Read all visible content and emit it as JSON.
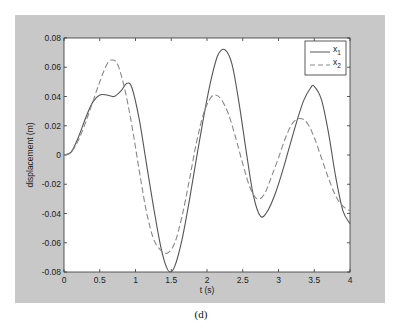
{
  "chart_data": {
    "type": "line",
    "title": "",
    "xlabel": "t (s)",
    "ylabel": "displacement (m)",
    "caption": "(d)",
    "xlim": [
      0,
      4
    ],
    "ylim": [
      -0.08,
      0.08
    ],
    "xticks": [
      0,
      0.5,
      1,
      1.5,
      2,
      2.5,
      3,
      3.5,
      4
    ],
    "xtick_labels": [
      "0",
      "0.5",
      "1",
      "1.5",
      "2",
      "2.5",
      "3",
      "3.5",
      "4"
    ],
    "yticks": [
      -0.08,
      -0.06,
      -0.04,
      -0.02,
      0,
      0.02,
      0.04,
      0.06,
      0.08
    ],
    "ytick_labels": [
      "-0.08",
      "-0.06",
      "-0.04",
      "-0.02",
      "0",
      "0.02",
      "0.04",
      "0.06",
      "0.08"
    ],
    "grid": false,
    "legend_position": "upper right",
    "series": [
      {
        "name": "x1",
        "label_base": "x",
        "label_sub": "1",
        "style": "solid",
        "color": "#555555",
        "x": [
          0,
          0.1,
          0.2,
          0.3,
          0.4,
          0.5,
          0.6,
          0.7,
          0.8,
          0.88,
          0.95,
          1.05,
          1.15,
          1.25,
          1.35,
          1.42,
          1.48,
          1.55,
          1.65,
          1.75,
          1.85,
          1.95,
          2.05,
          2.15,
          2.25,
          2.35,
          2.45,
          2.55,
          2.65,
          2.75,
          2.85,
          2.95,
          3.05,
          3.15,
          3.25,
          3.35,
          3.45,
          3.5,
          3.6,
          3.7,
          3.8,
          3.9,
          4.0
        ],
        "y": [
          0.0,
          0.002,
          0.012,
          0.025,
          0.036,
          0.041,
          0.041,
          0.04,
          0.044,
          0.049,
          0.046,
          0.025,
          -0.005,
          -0.035,
          -0.062,
          -0.075,
          -0.08,
          -0.076,
          -0.058,
          -0.032,
          -0.003,
          0.025,
          0.05,
          0.068,
          0.072,
          0.062,
          0.035,
          0.002,
          -0.028,
          -0.042,
          -0.038,
          -0.027,
          -0.012,
          0.005,
          0.022,
          0.037,
          0.046,
          0.047,
          0.038,
          0.015,
          -0.015,
          -0.038,
          -0.047
        ]
      },
      {
        "name": "x2",
        "label_base": "x",
        "label_sub": "2",
        "style": "dashed",
        "color": "#888888",
        "x": [
          0,
          0.1,
          0.2,
          0.3,
          0.4,
          0.5,
          0.6,
          0.67,
          0.75,
          0.85,
          0.95,
          1.05,
          1.15,
          1.25,
          1.35,
          1.45,
          1.55,
          1.65,
          1.75,
          1.85,
          1.95,
          2.05,
          2.12,
          2.2,
          2.3,
          2.4,
          2.5,
          2.6,
          2.7,
          2.8,
          2.9,
          3.0,
          3.1,
          3.2,
          3.3,
          3.4,
          3.5,
          3.6,
          3.7,
          3.8,
          3.9,
          4.0
        ],
        "y": [
          0.0,
          0.002,
          0.01,
          0.022,
          0.036,
          0.05,
          0.062,
          0.065,
          0.062,
          0.045,
          0.02,
          -0.01,
          -0.038,
          -0.057,
          -0.065,
          -0.067,
          -0.06,
          -0.042,
          -0.018,
          0.008,
          0.028,
          0.039,
          0.041,
          0.038,
          0.028,
          0.012,
          -0.006,
          -0.022,
          -0.03,
          -0.027,
          -0.015,
          -0.002,
          0.012,
          0.022,
          0.025,
          0.022,
          0.012,
          -0.002,
          -0.016,
          -0.028,
          -0.035,
          -0.038
        ]
      }
    ]
  }
}
